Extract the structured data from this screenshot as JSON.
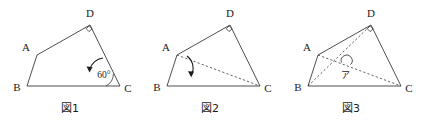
{
  "sheet": {
    "background_color": "#ffffff",
    "line_color": "#3a3a3a",
    "text_color": "#1c1c1c"
  },
  "figures": [
    {
      "caption": "図1",
      "vertices": {
        "A": {
          "label": "A",
          "x": 37,
          "y": 55
        },
        "B": {
          "label": "B",
          "x": 27,
          "y": 86
        },
        "C": {
          "label": "C",
          "x": 120,
          "y": 86
        },
        "D": {
          "label": "D",
          "x": 90,
          "y": 25
        }
      },
      "right_angle_at": "D",
      "angle_label": "60°",
      "has_rotation_arrow": true,
      "diagonals": []
    },
    {
      "caption": "図2",
      "vertices": {
        "A": {
          "label": "A",
          "x": 37,
          "y": 55
        },
        "B": {
          "label": "B",
          "x": 27,
          "y": 86
        },
        "C": {
          "label": "C",
          "x": 120,
          "y": 86
        },
        "D": {
          "label": "D",
          "x": 90,
          "y": 25
        }
      },
      "right_angle_at": "D",
      "angle_label": "",
      "has_rotation_arrow": true,
      "diagonals": [
        "A-C"
      ]
    },
    {
      "caption": "図3",
      "vertices": {
        "A": {
          "label": "A",
          "x": 37,
          "y": 55
        },
        "B": {
          "label": "B",
          "x": 27,
          "y": 86
        },
        "C": {
          "label": "C",
          "x": 120,
          "y": 86
        },
        "D": {
          "label": "D",
          "x": 90,
          "y": 25
        }
      },
      "right_angle_at": "D",
      "angle_label": "",
      "has_rotation_arrow": false,
      "diagonals": [
        "A-C",
        "B-D"
      ],
      "intersection_label": "ア"
    }
  ]
}
